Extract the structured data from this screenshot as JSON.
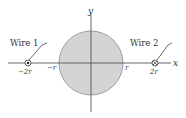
{
  "diagram": {
    "axes": {
      "x_label": "x",
      "y_label": "y"
    },
    "cylinder": {
      "fill": "#d4d4d4",
      "stroke": "#8a8a8a",
      "left_label": "−r",
      "right_label": "r"
    },
    "wires": [
      {
        "name": "Wire 1",
        "label": "Wire 1",
        "position_label": "−2r",
        "symbol": "dot-in-circle",
        "direction": "out of page"
      },
      {
        "name": "Wire 2",
        "label": "Wire 2",
        "position_label": "2r",
        "symbol": "cross-in-circle",
        "direction": "into page"
      }
    ],
    "colors": {
      "axis": "#555555",
      "text": "#333333",
      "fill": "#d4d4d4"
    }
  }
}
